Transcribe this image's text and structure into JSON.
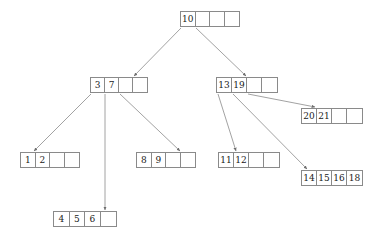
{
  "diagram": {
    "type": "b-tree",
    "node_order": 5,
    "colors": {
      "background": "#ffffff",
      "border": "#8a8a8a",
      "text": "#1a1a1a",
      "edge": "#8a8a8a"
    },
    "nodes": [
      {
        "id": "root",
        "name": "root-node",
        "level": 0,
        "x": 180,
        "y": 11,
        "cell_width": 15,
        "keys": [
          "10",
          "",
          "",
          ""
        ]
      },
      {
        "id": "internal-left",
        "name": "internal-node-left",
        "level": 1,
        "x": 90,
        "y": 77,
        "cell_width": 14.5,
        "keys": [
          "3",
          "7",
          "",
          ""
        ]
      },
      {
        "id": "internal-right",
        "name": "internal-node-right",
        "level": 1,
        "x": 216,
        "y": 77,
        "cell_width": 15.5,
        "keys": [
          "13",
          "19",
          "",
          ""
        ]
      },
      {
        "id": "leaf-1-2",
        "name": "leaf-node-1-2",
        "level": 2,
        "x": 20,
        "y": 152,
        "cell_width": 15,
        "keys": [
          "1",
          "2",
          "",
          ""
        ]
      },
      {
        "id": "leaf-4-5-6",
        "name": "leaf-node-4-5-6",
        "level": 3,
        "x": 53,
        "y": 211,
        "cell_width": 16,
        "keys": [
          "4",
          "5",
          "6",
          ""
        ]
      },
      {
        "id": "leaf-8-9",
        "name": "leaf-node-8-9",
        "level": 2,
        "x": 136,
        "y": 152,
        "cell_width": 15,
        "keys": [
          "8",
          "9",
          "",
          ""
        ]
      },
      {
        "id": "leaf-11-12",
        "name": "leaf-node-11-12",
        "level": 2,
        "x": 218,
        "y": 152,
        "cell_width": 15.5,
        "keys": [
          "11",
          "12",
          "",
          ""
        ]
      },
      {
        "id": "leaf-20-21",
        "name": "leaf-node-20-21",
        "level": 2,
        "x": 301,
        "y": 108,
        "cell_width": 15.5,
        "keys": [
          "20",
          "21",
          "",
          ""
        ]
      },
      {
        "id": "leaf-14-15-16-18",
        "name": "leaf-node-14-15-16-18",
        "level": 2,
        "x": 301,
        "y": 170,
        "cell_width": 15.5,
        "keys": [
          "14",
          "15",
          "16",
          "18"
        ]
      }
    ],
    "edges": [
      {
        "name": "edge-root-to-internal-left",
        "from": "root",
        "to": "internal-left",
        "x1": 181,
        "y1": 28,
        "x2": 134,
        "y2": 76
      },
      {
        "name": "edge-root-to-internal-right",
        "from": "root",
        "to": "internal-right",
        "x1": 196,
        "y1": 28,
        "x2": 246,
        "y2": 76
      },
      {
        "name": "edge-left-to-leaf-1-2",
        "from": "internal-left",
        "to": "leaf-1-2",
        "x1": 91,
        "y1": 94,
        "x2": 34,
        "y2": 151
      },
      {
        "name": "edge-left-to-leaf-4-5-6",
        "from": "internal-left",
        "to": "leaf-4-5-6",
        "x1": 105,
        "y1": 94,
        "x2": 105,
        "y2": 210
      },
      {
        "name": "edge-left-to-leaf-8-9",
        "from": "internal-left",
        "to": "leaf-8-9",
        "x1": 120,
        "y1": 94,
        "x2": 180,
        "y2": 151
      },
      {
        "name": "edge-right-to-leaf-11-12",
        "from": "internal-right",
        "to": "leaf-11-12",
        "x1": 218,
        "y1": 94,
        "x2": 236,
        "y2": 151
      },
      {
        "name": "edge-right-to-leaf-20-21",
        "from": "internal-right",
        "to": "leaf-20-21",
        "x1": 248,
        "y1": 94,
        "x2": 315,
        "y2": 107
      },
      {
        "name": "edge-right-to-leaf-14-18",
        "from": "internal-right",
        "to": "leaf-14-15-16-18",
        "x1": 233,
        "y1": 94,
        "x2": 307,
        "y2": 169
      }
    ]
  }
}
